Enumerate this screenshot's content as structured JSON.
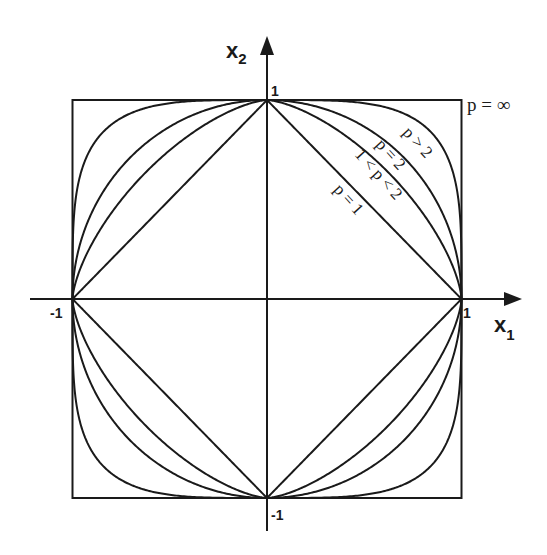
{
  "diagram": {
    "axes": {
      "x_label": "x",
      "x_subscript": "1",
      "y_label": "x",
      "y_subscript": "2",
      "ticks": {
        "x_pos": "1",
        "x_neg": "-1",
        "y_pos": "1",
        "y_neg": "-1"
      }
    },
    "curves": [
      {
        "id": "p1",
        "label": "p = 1",
        "p": 1
      },
      {
        "id": "p1to2",
        "label": "1 < p < 2",
        "p": 1.5
      },
      {
        "id": "p2",
        "label": "p = 2",
        "p": 2
      },
      {
        "id": "pgt2",
        "label": "p > 2",
        "p": 4
      },
      {
        "id": "pinf",
        "label": "p = ∞",
        "p": "infinity"
      }
    ],
    "colors": {
      "ink": "#1a1a1a",
      "background": "#ffffff"
    }
  }
}
